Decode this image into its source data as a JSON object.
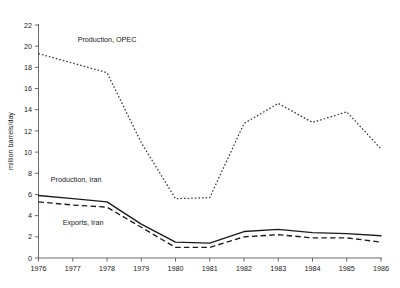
{
  "chart_data": {
    "type": "line",
    "title": "",
    "xlabel": "",
    "ylabel": "million barrels/day",
    "x": [
      1976,
      1977,
      1978,
      1979,
      1980,
      1981,
      1982,
      1983,
      1984,
      1985,
      1986
    ],
    "categories": [
      "1976",
      "1977",
      "1978",
      "1979",
      "1980",
      "1981",
      "1982",
      "1983",
      "1984",
      "1985",
      "1986"
    ],
    "xlim": [
      1976,
      1986
    ],
    "ylim": [
      0,
      22
    ],
    "yticks": [
      0,
      2,
      4,
      6,
      8,
      10,
      12,
      14,
      16,
      18,
      20,
      22
    ],
    "ytick_labels": [
      "0",
      "2",
      "4",
      "6",
      "8",
      "10",
      "12",
      "14",
      "16",
      "18",
      "20",
      "22"
    ],
    "grid": false,
    "legend_position": "inline-annotations",
    "series": [
      {
        "name": "Production, OPEC",
        "style": "dotted",
        "values": [
          19.3,
          18.4,
          17.5,
          10.9,
          5.6,
          5.7,
          12.7,
          14.6,
          12.8,
          13.8,
          10.3
        ]
      },
      {
        "name": "Production, Iran",
        "style": "solid",
        "values": [
          5.9,
          5.6,
          5.3,
          3.2,
          1.5,
          1.4,
          2.5,
          2.7,
          2.4,
          2.3,
          2.1
        ]
      },
      {
        "name": "Exports, Iran",
        "style": "dashed",
        "values": [
          5.3,
          5.0,
          4.8,
          2.9,
          1.0,
          1.0,
          2.0,
          2.2,
          1.9,
          1.9,
          1.5
        ]
      }
    ],
    "annotations": [
      {
        "text": "Production, OPEC",
        "x": 1978.0,
        "y": 20.4
      },
      {
        "text": "Production, Iran",
        "x": 1977.1,
        "y": 7.2
      },
      {
        "text": "Exports, Iran",
        "x": 1977.3,
        "y": 3.1
      }
    ],
    "colors": {
      "axis": "#5a5a5a",
      "text": "#1a1a1a",
      "opec_line": "#3a3a3a",
      "iran_production_line": "#1c1c1c",
      "iran_exports_line": "#1c1c1c",
      "background": "#ffffff"
    }
  }
}
